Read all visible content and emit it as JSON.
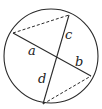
{
  "diagram": {
    "type": "intersecting-chords",
    "circle": {
      "cx": 51,
      "cy": 56,
      "r": 47
    },
    "stroke_color": "#2a2a2a",
    "points": {
      "P1": [
        13,
        33
      ],
      "P2": [
        91,
        76
      ],
      "P3": [
        69,
        15
      ],
      "P4": [
        43,
        104
      ],
      "X": [
        57,
        53
      ]
    },
    "solid_chords": [
      {
        "from": "P1",
        "to": "P2"
      },
      {
        "from": "P3",
        "to": "P4"
      }
    ],
    "dashed_segments": [
      {
        "from": "P1",
        "to": "P3"
      },
      {
        "from": "P4",
        "to": "P2"
      }
    ],
    "labels": {
      "a": "a",
      "b": "b",
      "c": "c",
      "d": "d"
    }
  }
}
